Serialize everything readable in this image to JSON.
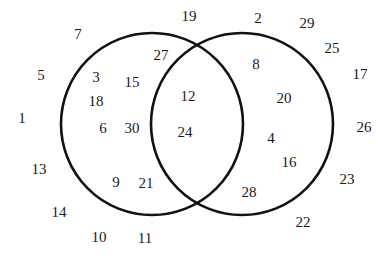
{
  "diagram": {
    "type": "venn-2set",
    "title": "",
    "stroke_color": "#111111",
    "fill_color": "#ffffff",
    "background_color": "#ffffff",
    "text_color": "#1a1a1a",
    "stroke_width": 2.6,
    "circles": [
      {
        "name": "left-circle",
        "cx": 152,
        "cy": 124,
        "r": 91
      },
      {
        "name": "right-circle",
        "cx": 242,
        "cy": 124,
        "r": 91
      }
    ]
  },
  "regions": {
    "left_only": [
      3,
      15,
      18,
      6,
      30,
      27,
      9,
      21
    ],
    "intersection": [
      12,
      24
    ],
    "right_only": [
      8,
      20,
      4,
      16,
      28
    ],
    "outside": [
      7,
      19,
      2,
      29,
      25,
      17,
      5,
      26,
      1,
      13,
      23,
      14,
      22,
      10,
      11
    ]
  },
  "labels": [
    {
      "id": "label-7",
      "value": "7",
      "x": 78,
      "y": 34,
      "region": "outside"
    },
    {
      "id": "label-19",
      "value": "19",
      "x": 189,
      "y": 16,
      "region": "outside"
    },
    {
      "id": "label-2",
      "value": "2",
      "x": 258,
      "y": 18,
      "region": "outside"
    },
    {
      "id": "label-29",
      "value": "29",
      "x": 307,
      "y": 23,
      "region": "outside"
    },
    {
      "id": "label-25",
      "value": "25",
      "x": 332,
      "y": 48,
      "region": "outside"
    },
    {
      "id": "label-17",
      "value": "17",
      "x": 360,
      "y": 74,
      "region": "outside"
    },
    {
      "id": "label-5",
      "value": "5",
      "x": 41,
      "y": 75,
      "region": "outside"
    },
    {
      "id": "label-26",
      "value": "26",
      "x": 364,
      "y": 127,
      "region": "outside"
    },
    {
      "id": "label-1",
      "value": "1",
      "x": 22,
      "y": 118,
      "region": "outside"
    },
    {
      "id": "label-13",
      "value": "13",
      "x": 39,
      "y": 169,
      "region": "outside"
    },
    {
      "id": "label-23",
      "value": "23",
      "x": 347,
      "y": 179,
      "region": "outside"
    },
    {
      "id": "label-14",
      "value": "14",
      "x": 59,
      "y": 212,
      "region": "outside"
    },
    {
      "id": "label-22",
      "value": "22",
      "x": 303,
      "y": 222,
      "region": "outside"
    },
    {
      "id": "label-10",
      "value": "10",
      "x": 99,
      "y": 237,
      "region": "outside"
    },
    {
      "id": "label-11",
      "value": "11",
      "x": 145,
      "y": 238,
      "region": "outside"
    },
    {
      "id": "label-27",
      "value": "27",
      "x": 161,
      "y": 55,
      "region": "left_only"
    },
    {
      "id": "label-3",
      "value": "3",
      "x": 96,
      "y": 77,
      "region": "left_only"
    },
    {
      "id": "label-15",
      "value": "15",
      "x": 132,
      "y": 82,
      "region": "left_only"
    },
    {
      "id": "label-18",
      "value": "18",
      "x": 96,
      "y": 101,
      "region": "left_only"
    },
    {
      "id": "label-6",
      "value": "6",
      "x": 103,
      "y": 128,
      "region": "left_only"
    },
    {
      "id": "label-30",
      "value": "30",
      "x": 132,
      "y": 128,
      "region": "left_only"
    },
    {
      "id": "label-9",
      "value": "9",
      "x": 116,
      "y": 182,
      "region": "left_only"
    },
    {
      "id": "label-21",
      "value": "21",
      "x": 146,
      "y": 183,
      "region": "left_only"
    },
    {
      "id": "label-12",
      "value": "12",
      "x": 188,
      "y": 96,
      "region": "intersection"
    },
    {
      "id": "label-24",
      "value": "24",
      "x": 185,
      "y": 132,
      "region": "intersection"
    },
    {
      "id": "label-8",
      "value": "8",
      "x": 256,
      "y": 64,
      "region": "right_only"
    },
    {
      "id": "label-20",
      "value": "20",
      "x": 284,
      "y": 98,
      "region": "right_only"
    },
    {
      "id": "label-4",
      "value": "4",
      "x": 271,
      "y": 138,
      "region": "right_only"
    },
    {
      "id": "label-16",
      "value": "16",
      "x": 289,
      "y": 162,
      "region": "right_only"
    },
    {
      "id": "label-28",
      "value": "28",
      "x": 249,
      "y": 192,
      "region": "right_only"
    }
  ]
}
